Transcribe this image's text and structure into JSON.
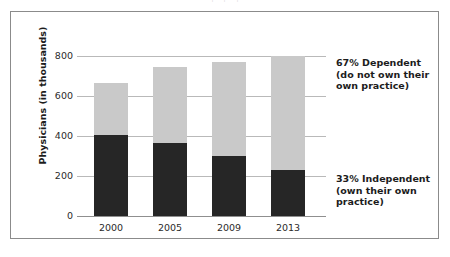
{
  "figure": {
    "top_cut_text": "｜            ｜           ｜"
  },
  "chart_data": {
    "type": "bar",
    "subtype": "stacked",
    "title": "",
    "xlabel": "",
    "ylabel": "Physicians (in thousands)",
    "categories": [
      "2000",
      "2005",
      "2009",
      "2013"
    ],
    "ylim": [
      0,
      800
    ],
    "yticks": [
      0,
      200,
      400,
      600,
      800
    ],
    "ytick_labels": [
      "0",
      "200",
      "400",
      "600",
      "800"
    ],
    "grid": true,
    "grid_axis": "y",
    "legend": "none",
    "series": [
      {
        "name": "Independent (own their own practice)",
        "color": "#262626",
        "values": [
          405,
          365,
          300,
          230
        ]
      },
      {
        "name": "Dependent (do not own their own practice)",
        "color": "#c9c9c9",
        "values": [
          260,
          380,
          468,
          570
        ]
      }
    ],
    "totals": [
      665,
      745,
      768,
      800
    ],
    "annotations": [
      {
        "id": "dependent",
        "text": "67% Dependent\n(do not own their\nown practice)",
        "target_series": "Dependent (do not own their own practice)"
      },
      {
        "id": "independent",
        "text": "33% Independent\n(own their own\npractice)",
        "target_series": "Independent (own their own practice)"
      }
    ]
  }
}
